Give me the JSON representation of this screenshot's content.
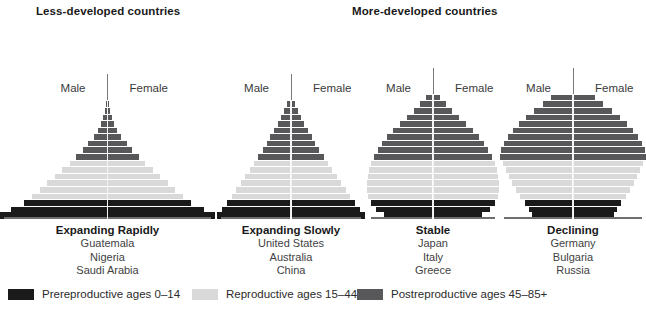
{
  "headings": {
    "less_developed": "Less-developed countries",
    "more_developed": "More-developed countries"
  },
  "axis_labels": {
    "male": "Male",
    "female": "Female"
  },
  "colors": {
    "prereproductive": "#1a1a1a",
    "reproductive": "#d9d9d9",
    "postreproductive": "#58585b",
    "axis": "#7a7a7a",
    "baseline": "#6e6e6e",
    "text": "#231f20"
  },
  "legend": {
    "items": [
      {
        "label": "Prereproductive ages 0–14",
        "color": "#1a1a1a",
        "swatch": "prereproductive-swatch"
      },
      {
        "label": "Reproductive ages 15–44",
        "color": "#d9d9d9",
        "swatch": "reproductive-swatch"
      },
      {
        "label": "Postreproductive ages 45–85+",
        "color": "#58585b",
        "swatch": "postreproductive-swatch"
      }
    ]
  },
  "chart_data": {
    "type": "bar",
    "orientation": "horizontal-back-to-back-population-pyramid",
    "xlabel": "",
    "ylabel": "",
    "grid": false,
    "legend_position": "bottom",
    "categories": [
      "Prereproductive ages 0–14",
      "Reproductive ages 15–44",
      "Postreproductive ages 45–85+"
    ],
    "pyramids": [
      {
        "group": "Less-developed countries",
        "title": "Expanding Rapidly",
        "countries": [
          "Guatemala",
          "Nigeria",
          "Saudi Arabia"
        ],
        "male_label": "Male",
        "female_label": "Female",
        "bars": [
          {
            "stage": "prereproductive",
            "width": 100
          },
          {
            "stage": "prereproductive",
            "width": 90
          },
          {
            "stage": "prereproductive",
            "width": 78
          },
          {
            "stage": "reproductive",
            "width": 70
          },
          {
            "stage": "reproductive",
            "width": 63
          },
          {
            "stage": "reproductive",
            "width": 56
          },
          {
            "stage": "reproductive",
            "width": 49
          },
          {
            "stage": "reproductive",
            "width": 42
          },
          {
            "stage": "reproductive",
            "width": 35
          },
          {
            "stage": "postreproductive",
            "width": 29
          },
          {
            "stage": "postreproductive",
            "width": 23
          },
          {
            "stage": "postreproductive",
            "width": 18
          },
          {
            "stage": "postreproductive",
            "width": 13
          },
          {
            "stage": "postreproductive",
            "width": 9
          },
          {
            "stage": "postreproductive",
            "width": 6
          },
          {
            "stage": "postreproductive",
            "width": 4
          },
          {
            "stage": "postreproductive",
            "width": 2.6
          },
          {
            "stage": "postreproductive",
            "width": 1.6
          }
        ]
      },
      {
        "group": "Less-developed countries",
        "title": "Expanding Slowly",
        "countries": [
          "United States",
          "Australia",
          "China"
        ],
        "male_label": "Male",
        "female_label": "Female",
        "bars": [
          {
            "stage": "prereproductive",
            "width": 100
          },
          {
            "stage": "prereproductive",
            "width": 93
          },
          {
            "stage": "prereproductive",
            "width": 86
          },
          {
            "stage": "reproductive",
            "width": 80
          },
          {
            "stage": "reproductive",
            "width": 74
          },
          {
            "stage": "reproductive",
            "width": 68
          },
          {
            "stage": "reproductive",
            "width": 62
          },
          {
            "stage": "reproductive",
            "width": 56
          },
          {
            "stage": "reproductive",
            "width": 50
          },
          {
            "stage": "postreproductive",
            "width": 44
          },
          {
            "stage": "postreproductive",
            "width": 38
          },
          {
            "stage": "postreproductive",
            "width": 33
          },
          {
            "stage": "postreproductive",
            "width": 28
          },
          {
            "stage": "postreproductive",
            "width": 23
          },
          {
            "stage": "postreproductive",
            "width": 18
          },
          {
            "stage": "postreproductive",
            "width": 13
          },
          {
            "stage": "postreproductive",
            "width": 9
          },
          {
            "stage": "postreproductive",
            "width": 5
          }
        ]
      },
      {
        "group": "More-developed countries",
        "title": "Stable",
        "countries": [
          "Japan",
          "Italy",
          "Greece"
        ],
        "male_label": "Male",
        "female_label": "Female",
        "bars": [
          {
            "stage": "prereproductive",
            "width": 74
          },
          {
            "stage": "prereproductive",
            "width": 86
          },
          {
            "stage": "prereproductive",
            "width": 94
          },
          {
            "stage": "reproductive",
            "width": 99
          },
          {
            "stage": "reproductive",
            "width": 100
          },
          {
            "stage": "reproductive",
            "width": 100
          },
          {
            "stage": "reproductive",
            "width": 99
          },
          {
            "stage": "reproductive",
            "width": 97
          },
          {
            "stage": "reproductive",
            "width": 94
          },
          {
            "stage": "postreproductive",
            "width": 90
          },
          {
            "stage": "postreproductive",
            "width": 84
          },
          {
            "stage": "postreproductive",
            "width": 77
          },
          {
            "stage": "postreproductive",
            "width": 69
          },
          {
            "stage": "postreproductive",
            "width": 60
          },
          {
            "stage": "postreproductive",
            "width": 50
          },
          {
            "stage": "postreproductive",
            "width": 40
          },
          {
            "stage": "postreproductive",
            "width": 29
          },
          {
            "stage": "postreproductive",
            "width": 19
          },
          {
            "stage": "postreproductive",
            "width": 10
          }
        ]
      },
      {
        "group": "More-developed countries",
        "title": "Declining",
        "countries": [
          "Germany",
          "Bulgaria",
          "Russia"
        ],
        "male_label": "Male",
        "female_label": "Female",
        "bars": [
          {
            "stage": "prereproductive",
            "width": 56
          },
          {
            "stage": "prereproductive",
            "width": 60
          },
          {
            "stage": "prereproductive",
            "width": 66
          },
          {
            "stage": "reproductive",
            "width": 72
          },
          {
            "stage": "reproductive",
            "width": 78
          },
          {
            "stage": "reproductive",
            "width": 83
          },
          {
            "stage": "reproductive",
            "width": 88
          },
          {
            "stage": "reproductive",
            "width": 92
          },
          {
            "stage": "reproductive",
            "width": 96
          },
          {
            "stage": "postreproductive",
            "width": 100
          },
          {
            "stage": "postreproductive",
            "width": 99
          },
          {
            "stage": "postreproductive",
            "width": 95
          },
          {
            "stage": "postreproductive",
            "width": 89
          },
          {
            "stage": "postreproductive",
            "width": 82
          },
          {
            "stage": "postreproductive",
            "width": 74
          },
          {
            "stage": "postreproductive",
            "width": 64
          },
          {
            "stage": "postreproductive",
            "width": 53
          },
          {
            "stage": "postreproductive",
            "width": 41
          },
          {
            "stage": "postreproductive",
            "width": 30
          }
        ]
      }
    ]
  }
}
